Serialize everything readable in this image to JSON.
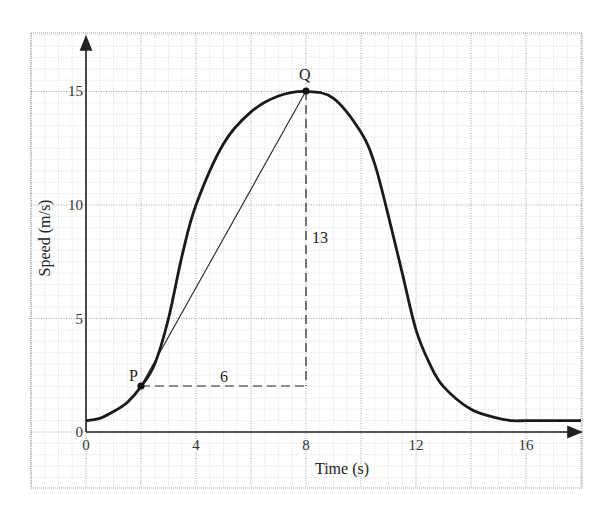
{
  "chart_data": {
    "type": "line",
    "title": "",
    "xlabel": "Time (s)",
    "ylabel": "Speed (m/s)",
    "xlim": [
      0,
      18
    ],
    "ylim": [
      0,
      17
    ],
    "x_ticks": [
      "0",
      "4",
      "8",
      "12",
      "16"
    ],
    "y_ticks": [
      "0",
      "5",
      "10",
      "15"
    ],
    "grid": true,
    "legend": null,
    "series": [
      {
        "name": "speed-time curve",
        "x": [
          0,
          0.5,
          1,
          1.5,
          2,
          2.5,
          3,
          3.5,
          4,
          5,
          6,
          7,
          8,
          9,
          10,
          10.5,
          11,
          11.5,
          12,
          12.5,
          13,
          14,
          15,
          15.5,
          16,
          17,
          18
        ],
        "y": [
          0.5,
          0.6,
          0.9,
          1.3,
          2.0,
          3.0,
          5.0,
          7.8,
          10.0,
          12.7,
          14.1,
          14.8,
          15.0,
          14.7,
          13.2,
          11.8,
          9.5,
          7.0,
          4.5,
          3.0,
          2.0,
          1.0,
          0.6,
          0.5,
          0.5,
          0.5,
          0.5
        ]
      }
    ],
    "annotations": [
      {
        "label": "P",
        "x": 2,
        "y": 2,
        "type": "point"
      },
      {
        "label": "Q",
        "x": 8,
        "y": 15,
        "type": "point"
      },
      {
        "type": "line",
        "from": [
          2,
          2
        ],
        "to": [
          8,
          15
        ],
        "description": "chord PQ"
      },
      {
        "type": "dashed-line",
        "from": [
          2,
          2
        ],
        "to": [
          8,
          2
        ],
        "label": "6"
      },
      {
        "type": "dashed-line",
        "from": [
          8,
          2
        ],
        "to": [
          8,
          15
        ],
        "label": "13"
      }
    ]
  },
  "labels": {
    "x_title": "Time (s)",
    "y_title": "Speed (m/s)",
    "point_p": "P",
    "point_q": "Q",
    "run": "6",
    "rise": "13",
    "x_ticks": [
      "0",
      "4",
      "8",
      "12",
      "16"
    ],
    "y_ticks": [
      "0",
      "5",
      "10",
      "15"
    ]
  },
  "colors": {
    "curve": "#1a1a1a",
    "grid_major": "#9a9a9a",
    "grid_minor": "#c8c8c8",
    "axis": "#222222"
  }
}
